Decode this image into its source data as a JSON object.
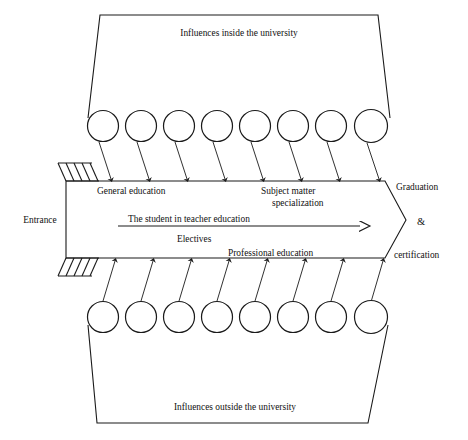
{
  "diagram": {
    "title_top": "Influences inside the university",
    "title_bottom": "Influences outside the university",
    "entrance_label": "Entrance",
    "pipeline": {
      "band_top_label": "General education",
      "band_top_right_label_line1": "Subject matter",
      "band_top_right_label_line2": "specialization",
      "center_label": "The student in teacher education",
      "electives_label": "Electives",
      "professional_label": "Professional education"
    },
    "exit": {
      "line1": "Graduation",
      "line2": "&",
      "line3": "certification"
    },
    "counts": {
      "top_influence_nodes": 8,
      "bottom_influence_nodes": 8
    },
    "colors": {
      "stroke": "#1a1a1a",
      "background": "#ffffff"
    }
  }
}
